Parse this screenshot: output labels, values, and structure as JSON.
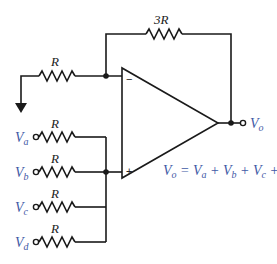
{
  "diagram": {
    "type": "non-inverting summing amplifier",
    "feedback_resistor": {
      "label": "3R"
    },
    "ground_resistor": {
      "label": "R"
    },
    "opamp": {
      "inverting_sign": "−",
      "noninverting_sign": "+"
    },
    "inputs": [
      {
        "name": "V",
        "sub": "a",
        "resistor": "R"
      },
      {
        "name": "V",
        "sub": "b",
        "resistor": "R"
      },
      {
        "name": "V",
        "sub": "c",
        "resistor": "R"
      },
      {
        "name": "V",
        "sub": "d",
        "resistor": "R"
      }
    ],
    "output": {
      "name": "V",
      "sub": "o"
    },
    "equation": {
      "lhs": {
        "name": "V",
        "sub": "o"
      },
      "eq": " = ",
      "terms": [
        {
          "name": "V",
          "sub": "a"
        },
        {
          "name": "V",
          "sub": "b"
        },
        {
          "name": "V",
          "sub": "c"
        },
        {
          "name": "V",
          "sub": "d"
        }
      ],
      "plus": " + "
    },
    "colors": {
      "wire": "#1a1a1a",
      "label_blue": "#3f5aa6"
    }
  }
}
